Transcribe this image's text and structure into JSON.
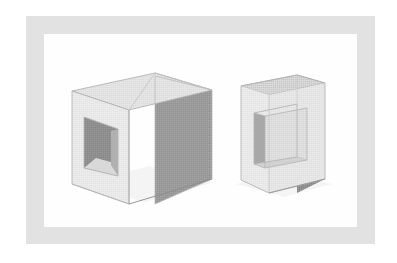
{
  "image": {
    "kind": "technical-illustration",
    "subject": "two grayscale 3D block solids in perspective",
    "title_text": "",
    "caption_text": "",
    "labels": [],
    "background_color": "#ffffff"
  },
  "frame": {
    "mat_color": "#e2e2e2",
    "canvas_color": "#fefefe",
    "mat_rect": {
      "x": 26,
      "y": 16,
      "w": 349,
      "h": 228
    },
    "canvas_rect": {
      "x": 44,
      "y": 34,
      "w": 313,
      "h": 193
    }
  },
  "palette": {
    "top_face": "#e3e3e3",
    "top_face_dark": "#d4d4d4",
    "front_face": "#eaeaea",
    "front_face_alt": "#e6e6e6",
    "right_face": "#9a9a9a",
    "right_face_dark": "#8e8e8e",
    "hole_interior": "#8d8d8d",
    "hole_interior_dark": "#828282",
    "hole_floor": "#d9d9d9",
    "recess_floor": "#dedede",
    "recess_wall": "#a8a8a8",
    "recess_wall_dark": "#9c9c9c",
    "outline": "#b4b4b4",
    "outline_soft": "#c6c6c6",
    "shadow": "#f0f0f0"
  },
  "objects": [
    {
      "id": "cube-with-through-hole",
      "name": "Cube with square through-hole",
      "position": "left",
      "faces": [
        {
          "name": "top-face",
          "shade": "light"
        },
        {
          "name": "front-left-face",
          "shade": "light"
        },
        {
          "name": "right-face",
          "shade": "medium-dark"
        },
        {
          "name": "hole-opening",
          "shade": "dark"
        },
        {
          "name": "hole-inner-floor",
          "shade": "light"
        }
      ],
      "feature": "square aperture cut through the front-left face"
    },
    {
      "id": "slab-with-square-recess",
      "name": "Flat slab with square recess",
      "position": "right",
      "faces": [
        {
          "name": "top-face",
          "shade": "light"
        },
        {
          "name": "front-face",
          "shade": "light"
        },
        {
          "name": "right-face",
          "shade": "medium-dark"
        },
        {
          "name": "recess-left-wall",
          "shade": "medium-dark"
        },
        {
          "name": "recess-floor",
          "shade": "light"
        },
        {
          "name": "recess-bottom-wall",
          "shade": "light"
        }
      ],
      "feature": "square blind pocket recessed into the front face"
    }
  ]
}
